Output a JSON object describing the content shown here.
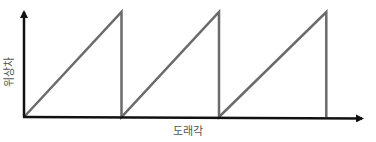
{
  "chart_data": {
    "type": "line",
    "title": "",
    "xlabel": "도래각",
    "ylabel": "위상차",
    "grid": false,
    "legend": null,
    "series": [
      {
        "name": "phase-difference",
        "color": "#6b6b6b",
        "points": [
          {
            "x": 0,
            "y": 0
          },
          {
            "x": 1,
            "y": 1
          },
          {
            "x": 1,
            "y": 0
          },
          {
            "x": 2,
            "y": 1
          },
          {
            "x": 2,
            "y": 0
          },
          {
            "x": 3.1,
            "y": 1
          },
          {
            "x": 3.1,
            "y": 0
          }
        ]
      }
    ],
    "xlim": [
      0,
      3.5
    ],
    "ylim": [
      0,
      1.05
    ],
    "axis_color": "#111111"
  }
}
